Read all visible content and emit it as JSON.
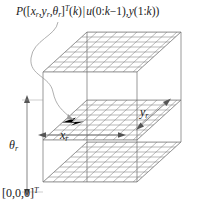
{
  "figure": {
    "title_formula": {
      "parts": [
        "P([",
        "x",
        "r",
        ", ",
        "y",
        "r",
        ", ",
        "θ",
        "r",
        "]",
        "T",
        "(",
        "k",
        ") | ",
        "u",
        "(0:",
        "k",
        "−1), ",
        "y",
        "(1:",
        "k",
        "))"
      ],
      "plain": "P([x_r, y_r, θ_r]^T (k) | u(0:k−1), y(1:k))",
      "P": "P",
      "open": "([",
      "x": "x",
      "sub_r": "r",
      "comma": ", ",
      "y": "y",
      "theta": "θ",
      "close_bracket": "]",
      "transpose": "T",
      "k_arg": "(k)",
      "given": " | ",
      "u": "u",
      "u_arg": "(0:k−1), ",
      "y2": "y",
      "y_arg": "(1:k))"
    },
    "labels": {
      "theta": "θ",
      "theta_sub": "r",
      "x": "x",
      "x_sub": "r",
      "y": "y",
      "y_sub": "r",
      "origin": "[0,0,0]",
      "origin_sup": "T"
    },
    "colors": {
      "grid_line": "#8c8c8c",
      "edge_line": "#6e6e6e",
      "marker": "#000000",
      "leader": "#9a9a9a",
      "arrow": "#555555",
      "background": "#ffffff",
      "text": "#1a1a1a"
    },
    "geometry": {
      "planes": 3,
      "plane_names": [
        "top-plane",
        "middle-plane",
        "bottom-plane"
      ],
      "grid_cols": 9,
      "grid_rows": 7,
      "marker_position": [
        75,
        121
      ],
      "dimension_arrows": [
        "theta-vertical",
        "x-horizontal",
        "y-diagonal"
      ]
    }
  }
}
